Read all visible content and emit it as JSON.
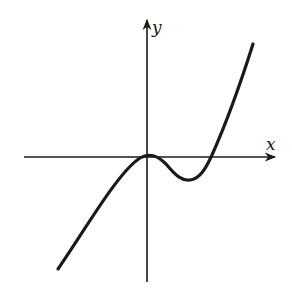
{
  "figure": {
    "axes": {
      "x_label": "x",
      "y_label": "y"
    },
    "colors": {
      "stroke": "#1a1a1a",
      "background": "#ffffff"
    }
  }
}
